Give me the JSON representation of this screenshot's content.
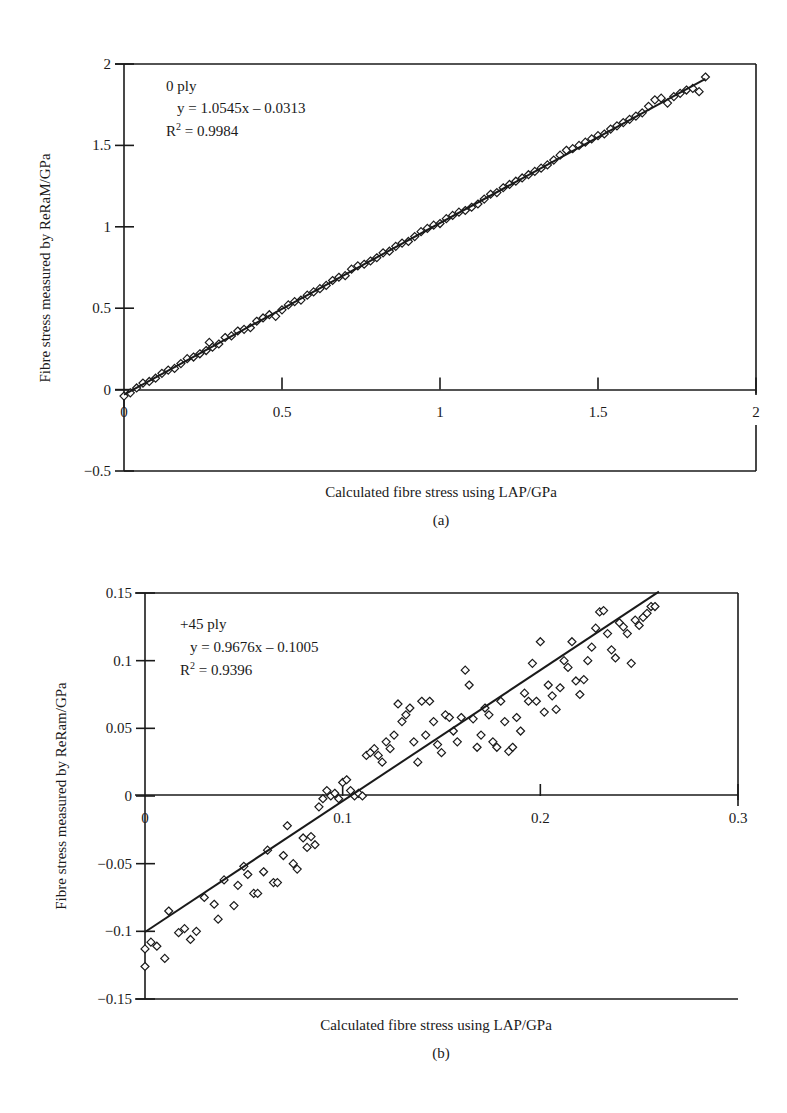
{
  "chart_data": [
    {
      "id": "a",
      "type": "scatter",
      "panel_label": "(a)",
      "title": "",
      "xlabel": "Calculated fibre stress using LAP/GPa",
      "ylabel": "Fibre stress measured by ReRaM/GPa",
      "xlim": [
        0,
        2
      ],
      "ylim": [
        -0.5,
        2
      ],
      "xticks": [
        "0",
        "0.5",
        "1",
        "1.5",
        "2"
      ],
      "yticks": [
        "-0.5",
        "0",
        "0.5",
        "1",
        "1.5",
        "2"
      ],
      "grid": false,
      "marker": "diamond-open",
      "annotation": {
        "series_name": "0 ply",
        "equation": "y = 1.0545x – 0.0313",
        "r2_label": "R",
        "r2_sup": "2",
        "r2_value": " = 0.9984"
      },
      "trendline": {
        "slope": 1.0545,
        "intercept": -0.0313,
        "x_range": [
          0,
          1.84
        ]
      },
      "series": [
        {
          "name": "0 ply",
          "x": [
            0.0,
            0.02,
            0.04,
            0.06,
            0.08,
            0.1,
            0.12,
            0.14,
            0.16,
            0.18,
            0.2,
            0.22,
            0.24,
            0.26,
            0.27,
            0.28,
            0.3,
            0.32,
            0.34,
            0.36,
            0.38,
            0.4,
            0.42,
            0.44,
            0.46,
            0.48,
            0.5,
            0.52,
            0.54,
            0.56,
            0.58,
            0.6,
            0.62,
            0.64,
            0.66,
            0.68,
            0.7,
            0.72,
            0.74,
            0.76,
            0.78,
            0.8,
            0.82,
            0.84,
            0.86,
            0.88,
            0.9,
            0.92,
            0.94,
            0.96,
            0.98,
            1.0,
            1.02,
            1.04,
            1.06,
            1.08,
            1.1,
            1.12,
            1.14,
            1.16,
            1.18,
            1.2,
            1.22,
            1.24,
            1.26,
            1.28,
            1.3,
            1.32,
            1.34,
            1.36,
            1.38,
            1.4,
            1.42,
            1.44,
            1.46,
            1.48,
            1.5,
            1.52,
            1.54,
            1.56,
            1.58,
            1.6,
            1.62,
            1.64,
            1.66,
            1.68,
            1.7,
            1.72,
            1.74,
            1.76,
            1.78,
            1.8,
            1.82,
            1.84
          ],
          "y": [
            -0.04,
            -0.02,
            0.01,
            0.04,
            0.05,
            0.07,
            0.1,
            0.12,
            0.13,
            0.16,
            0.19,
            0.2,
            0.22,
            0.24,
            0.29,
            0.26,
            0.28,
            0.32,
            0.33,
            0.36,
            0.37,
            0.38,
            0.42,
            0.44,
            0.46,
            0.45,
            0.49,
            0.52,
            0.54,
            0.55,
            0.58,
            0.6,
            0.62,
            0.64,
            0.67,
            0.69,
            0.7,
            0.74,
            0.76,
            0.77,
            0.79,
            0.81,
            0.84,
            0.85,
            0.88,
            0.9,
            0.91,
            0.94,
            0.97,
            0.99,
            1.01,
            1.02,
            1.05,
            1.07,
            1.09,
            1.1,
            1.12,
            1.14,
            1.17,
            1.2,
            1.21,
            1.24,
            1.26,
            1.28,
            1.3,
            1.32,
            1.34,
            1.36,
            1.38,
            1.41,
            1.44,
            1.47,
            1.48,
            1.5,
            1.52,
            1.54,
            1.56,
            1.57,
            1.6,
            1.62,
            1.64,
            1.66,
            1.68,
            1.7,
            1.74,
            1.78,
            1.79,
            1.76,
            1.8,
            1.82,
            1.84,
            1.85,
            1.83,
            1.92
          ]
        }
      ]
    },
    {
      "id": "b",
      "type": "scatter",
      "panel_label": "(b)",
      "title": "",
      "xlabel": "Calculated fibre stress using LAP/GPa",
      "ylabel": "Fibre stress measured by ReRam/GPa",
      "xlim": [
        0,
        0.3
      ],
      "ylim": [
        -0.15,
        0.15
      ],
      "xticks": [
        "0",
        "0.1",
        "0.2",
        "0.3"
      ],
      "yticks": [
        "-0.15",
        "-0.1",
        "-0.05",
        "0",
        "0.05",
        "0.1",
        "0.15"
      ],
      "grid": false,
      "marker": "diamond-open",
      "annotation": {
        "series_name": "+45 ply",
        "equation": "y = 0.9676x – 0.1005",
        "r2_label": "R",
        "r2_sup": "2",
        "r2_value": " = 0.9396"
      },
      "trendline": {
        "slope": 0.9676,
        "intercept": -0.1005,
        "x_range": [
          0,
          0.26
        ]
      },
      "series": [
        {
          "name": "+45 ply",
          "x": [
            0.0,
            0.0,
            0.003,
            0.006,
            0.01,
            0.012,
            0.017,
            0.02,
            0.023,
            0.026,
            0.03,
            0.035,
            0.037,
            0.04,
            0.045,
            0.047,
            0.05,
            0.052,
            0.055,
            0.057,
            0.06,
            0.062,
            0.065,
            0.067,
            0.07,
            0.072,
            0.075,
            0.077,
            0.08,
            0.082,
            0.084,
            0.086,
            0.088,
            0.09,
            0.092,
            0.094,
            0.096,
            0.098,
            0.1,
            0.102,
            0.104,
            0.106,
            0.108,
            0.11,
            0.112,
            0.114,
            0.116,
            0.118,
            0.12,
            0.122,
            0.124,
            0.126,
            0.128,
            0.13,
            0.132,
            0.134,
            0.136,
            0.138,
            0.14,
            0.142,
            0.144,
            0.146,
            0.148,
            0.15,
            0.152,
            0.154,
            0.156,
            0.158,
            0.16,
            0.162,
            0.164,
            0.166,
            0.168,
            0.17,
            0.172,
            0.174,
            0.176,
            0.178,
            0.18,
            0.182,
            0.184,
            0.186,
            0.188,
            0.19,
            0.192,
            0.194,
            0.196,
            0.198,
            0.2,
            0.202,
            0.204,
            0.206,
            0.208,
            0.21,
            0.212,
            0.214,
            0.216,
            0.218,
            0.22,
            0.222,
            0.224,
            0.226,
            0.228,
            0.23,
            0.232,
            0.234,
            0.236,
            0.238,
            0.24,
            0.242,
            0.244,
            0.246,
            0.248,
            0.25,
            0.252,
            0.254,
            0.256,
            0.258
          ],
          "y": [
            -0.113,
            -0.126,
            -0.108,
            -0.111,
            -0.12,
            -0.085,
            -0.101,
            -0.098,
            -0.106,
            -0.1,
            -0.075,
            -0.08,
            -0.091,
            -0.062,
            -0.081,
            -0.066,
            -0.052,
            -0.058,
            -0.072,
            -0.072,
            -0.056,
            -0.04,
            -0.064,
            -0.064,
            -0.044,
            -0.022,
            -0.05,
            -0.054,
            -0.031,
            -0.038,
            -0.03,
            -0.036,
            -0.008,
            -0.002,
            0.004,
            0.0,
            0.002,
            -0.002,
            0.01,
            0.012,
            0.004,
            0.0,
            0.002,
            0.0,
            0.03,
            0.032,
            0.035,
            0.03,
            0.025,
            0.04,
            0.035,
            0.045,
            0.068,
            0.055,
            0.06,
            0.065,
            0.04,
            0.025,
            0.07,
            0.045,
            0.07,
            0.055,
            0.038,
            0.032,
            0.06,
            0.058,
            0.048,
            0.04,
            0.058,
            0.093,
            0.082,
            0.057,
            0.036,
            0.045,
            0.065,
            0.06,
            0.04,
            0.036,
            0.07,
            0.055,
            0.033,
            0.036,
            0.058,
            0.048,
            0.076,
            0.07,
            0.098,
            0.07,
            0.114,
            0.062,
            0.082,
            0.074,
            0.064,
            0.08,
            0.1,
            0.095,
            0.114,
            0.085,
            0.075,
            0.086,
            0.1,
            0.11,
            0.124,
            0.136,
            0.137,
            0.12,
            0.108,
            0.102,
            0.128,
            0.125,
            0.12,
            0.098,
            0.13,
            0.126,
            0.132,
            0.135,
            0.14,
            0.14
          ]
        }
      ]
    }
  ]
}
